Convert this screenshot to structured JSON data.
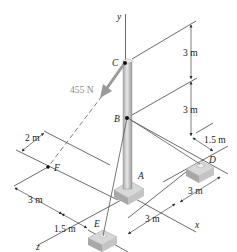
{
  "figure": {
    "type": "statics-3d-pole-cable",
    "axes": {
      "x": "x",
      "y": "y",
      "z": "z"
    },
    "points": {
      "A": "A",
      "B": "B",
      "C": "C",
      "D": "D",
      "E": "E",
      "F": "F"
    },
    "force": {
      "label": "455 N",
      "color": "#9a9a9a"
    },
    "dimensions": {
      "CB_vertical": "3 m",
      "BA_vertical": "3 m",
      "D_offset": "1.5 m",
      "D_x": "3 m",
      "E_x": "3 m",
      "E_z_offset": "1.5 m",
      "F_z": "3 m",
      "F_x": "2 m"
    },
    "colors": {
      "line": "#2a2a2a",
      "pole": "#c8c8c8",
      "base": "#bdbdbd",
      "force_arrow": "#9a9a9a"
    }
  }
}
